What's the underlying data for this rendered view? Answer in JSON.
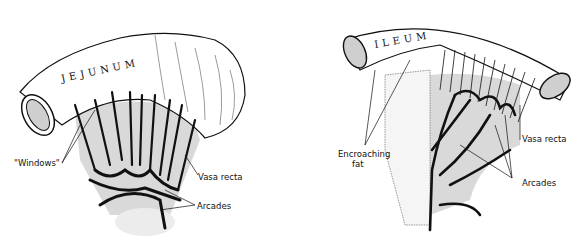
{
  "figure": {
    "left_panel": {
      "organ_label": "JEJUNUM",
      "callouts": {
        "windows": "\"Windows\"",
        "vasa_recta": "Vasa recta",
        "arcades": "Arcades"
      }
    },
    "right_panel": {
      "organ_label": "ILEUM",
      "callouts": {
        "encroaching_fat_line1": "Encroaching",
        "encroaching_fat_line2": "fat",
        "vasa_recta": "Vasa recta",
        "arcades": "Arcades"
      }
    },
    "colors": {
      "ink": "#111111",
      "mesentery_shade": "#d9d9d9",
      "background": "#ffffff"
    }
  }
}
